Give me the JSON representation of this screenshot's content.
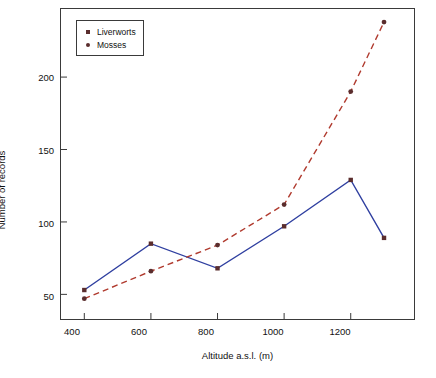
{
  "chart_data": {
    "type": "line",
    "title": "",
    "xlabel": "Altitude a.s.l. (m)",
    "ylabel": "Number of records",
    "x": [
      400,
      600,
      800,
      1000,
      1200,
      1300
    ],
    "xlim": [
      330,
      1390
    ],
    "ylim": [
      33,
      247
    ],
    "xticks": [
      400,
      600,
      800,
      1000,
      1200
    ],
    "yticks": [
      50,
      100,
      150,
      200
    ],
    "grid": false,
    "legend_position": "top-left",
    "series": [
      {
        "name": "Liverworts",
        "color": "#2f3fa0",
        "linestyle": "solid",
        "marker": "square",
        "values": [
          53,
          85,
          68,
          97,
          129,
          89
        ]
      },
      {
        "name": "Mosses",
        "color": "#b03a2e",
        "linestyle": "dashed",
        "marker": "circle",
        "values": [
          47,
          66,
          84,
          112,
          190,
          238
        ]
      }
    ]
  },
  "axes": {
    "x_tick_labels": [
      "400",
      "600",
      "800",
      "1000",
      "1200"
    ],
    "y_tick_labels": [
      "50",
      "100",
      "150",
      "200"
    ],
    "x_title": "Altitude a.s.l. (m)",
    "y_title": "Number of records"
  },
  "legend": {
    "items": [
      {
        "label": "Liverworts",
        "marker": "square-marker"
      },
      {
        "label": "Mosses",
        "marker": "circle-marker"
      }
    ]
  }
}
